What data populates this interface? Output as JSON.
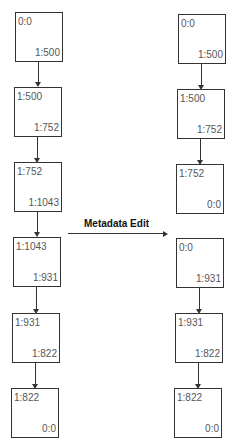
{
  "edge_label": "Metadata Edit",
  "left_chain": [
    {
      "top": "0:0",
      "bottom": "1:500"
    },
    {
      "top": "1:500",
      "bottom": "1:752"
    },
    {
      "top": "1:752",
      "bottom": "1:1043"
    },
    {
      "top": "1:1043",
      "bottom": "1:931"
    },
    {
      "top": "1:931",
      "bottom": "1:822"
    },
    {
      "top": "1:822",
      "bottom": "0:0"
    }
  ],
  "right_chain_a": [
    {
      "top": "0:0",
      "bottom": "1:500"
    },
    {
      "top": "1:500",
      "bottom": "1:752"
    },
    {
      "top": "1:752",
      "bottom": "0:0"
    }
  ],
  "right_chain_b": [
    {
      "top": "0:0",
      "bottom": "1:931"
    },
    {
      "top": "1:931",
      "bottom": "1:822"
    },
    {
      "top": "1:822",
      "bottom": "0:0"
    }
  ]
}
